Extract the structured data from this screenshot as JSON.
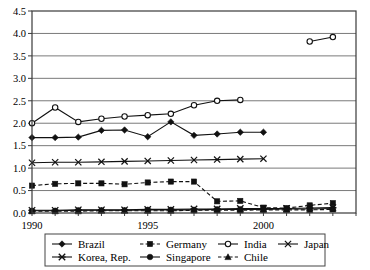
{
  "chart_data": {
    "type": "line",
    "title": "",
    "subtitle": "",
    "xlabel": "",
    "ylabel": "",
    "xlim": [
      1990,
      2004
    ],
    "ylim": [
      0.0,
      4.5
    ],
    "grid": true,
    "grid_axis": "y",
    "legend_position": "bottom",
    "legend_columns": 4,
    "ytick_labels": [
      "0.0",
      "0.5",
      "1.0",
      "1.5",
      "2.0",
      "2.5",
      "3.0",
      "3.5",
      "4.0",
      "4.5"
    ],
    "ytick_values": [
      0.0,
      0.5,
      1.0,
      1.5,
      2.0,
      2.5,
      3.0,
      3.5,
      4.0,
      4.5
    ],
    "xtick_labels": [
      "1990",
      "1995",
      "2000"
    ],
    "xtick_values": [
      1990,
      1995,
      2000
    ],
    "x": [
      1990,
      1991,
      1992,
      1993,
      1994,
      1995,
      1996,
      1997,
      1998,
      1999,
      2000,
      2001,
      2002,
      2003
    ],
    "series": [
      {
        "name": "Brazil",
        "marker": "diamond",
        "linestyle": "solid",
        "x": [
          1990,
          1991,
          1992,
          1993,
          1994,
          1995,
          1996,
          1997,
          1998,
          1999,
          2000
        ],
        "values": [
          1.68,
          1.68,
          1.69,
          1.84,
          1.85,
          1.7,
          2.03,
          1.73,
          1.76,
          1.8,
          1.8
        ]
      },
      {
        "name": "Germany",
        "marker": "square",
        "linestyle": "dashed",
        "x": [
          1990,
          1991,
          1992,
          1993,
          1994,
          1995,
          1996,
          1997,
          1998,
          1999,
          2000,
          2001,
          2002,
          2003
        ],
        "values": [
          0.61,
          0.65,
          0.66,
          0.66,
          0.64,
          0.68,
          0.7,
          0.7,
          0.26,
          0.27,
          0.12,
          0.11,
          0.17,
          0.22
        ]
      },
      {
        "name": "India",
        "marker": "circle-open",
        "linestyle": "solid",
        "x": [
          1990,
          1991,
          1992,
          1993,
          1994,
          1995,
          1996,
          1997,
          1998,
          1999,
          2002,
          2003
        ],
        "values": [
          2.0,
          2.35,
          2.03,
          2.1,
          2.15,
          2.18,
          2.21,
          2.4,
          2.5,
          2.52,
          3.82,
          3.92
        ],
        "segments": [
          {
            "x": [
              1990,
              1991,
              1992,
              1993,
              1994,
              1995,
              1996,
              1997,
              1998,
              1999
            ],
            "values": [
              2.0,
              2.35,
              2.03,
              2.1,
              2.15,
              2.18,
              2.21,
              2.4,
              2.5,
              2.52
            ]
          },
          {
            "x": [
              2002,
              2003
            ],
            "values": [
              3.82,
              3.92
            ]
          }
        ]
      },
      {
        "name": "Japan",
        "marker": "x-thin",
        "linestyle": "solid",
        "x": [
          1990,
          1991,
          1992,
          1993,
          1994,
          1995,
          1996,
          1997,
          1998,
          1999,
          2000
        ],
        "values": [
          1.12,
          1.13,
          1.13,
          1.14,
          1.15,
          1.16,
          1.17,
          1.18,
          1.19,
          1.2,
          1.21
        ]
      },
      {
        "name": "Korea, Rep.",
        "marker": "x-star",
        "linestyle": "solid",
        "x": [
          1990,
          1991,
          1992,
          1993,
          1994,
          1995,
          1996,
          1997,
          1998,
          1999,
          2000,
          2001,
          2002,
          2003
        ],
        "values": [
          0.06,
          0.06,
          0.07,
          0.07,
          0.07,
          0.08,
          0.08,
          0.09,
          0.09,
          0.1,
          0.1,
          0.1,
          0.11,
          0.12
        ]
      },
      {
        "name": "Singapore",
        "marker": "circle-filled",
        "linestyle": "solid",
        "x": [
          1990,
          1991,
          1992,
          1993,
          1994,
          1995,
          1996,
          1997,
          1998,
          1999,
          2000,
          2001,
          2002,
          2003
        ],
        "values": [
          0.05,
          0.05,
          0.06,
          0.06,
          0.06,
          0.07,
          0.07,
          0.07,
          0.08,
          0.08,
          0.08,
          0.09,
          0.09,
          0.1
        ]
      },
      {
        "name": "Chile",
        "marker": "triangle",
        "linestyle": "dashed",
        "x": [
          1990,
          1991,
          1992,
          1993,
          1994,
          1995,
          1996,
          1997,
          1998,
          1999,
          2000,
          2001,
          2002,
          2003
        ],
        "values": [
          0.04,
          0.04,
          0.04,
          0.05,
          0.05,
          0.05,
          0.05,
          0.06,
          0.06,
          0.06,
          0.07,
          0.07,
          0.07,
          0.08
        ]
      }
    ]
  },
  "legend": {
    "entries": [
      {
        "label": "Brazil"
      },
      {
        "label": "Germany"
      },
      {
        "label": "India"
      },
      {
        "label": "Japan"
      },
      {
        "label": "Korea, Rep."
      },
      {
        "label": "Singapore"
      },
      {
        "label": "Chile"
      }
    ]
  },
  "colors": {
    "line": "#111111",
    "grid": "#7a7a7a",
    "axis": "#3a3a3a",
    "background": "#ffffff"
  }
}
